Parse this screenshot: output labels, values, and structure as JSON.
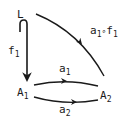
{
  "diagram": {
    "type": "commutative-diagram",
    "nodes": {
      "L": {
        "label": "L"
      },
      "A1": {
        "base": "A",
        "sub": "1"
      },
      "A2": {
        "base": "A",
        "sub": "2"
      }
    },
    "arrows": {
      "f1": {
        "from": "L",
        "to": "A1",
        "style": "hook-inclusion",
        "base": "f",
        "sub": "1"
      },
      "a1": {
        "from": "A1",
        "to": "A2",
        "base": "a",
        "sub": "1"
      },
      "a2": {
        "from": "A1",
        "to": "A2",
        "base": "a",
        "sub": "2"
      },
      "comp": {
        "from": "L",
        "to": "A2",
        "base1": "a",
        "sub1": "1",
        "op": "∘",
        "base2": "f",
        "sub2": "1"
      }
    },
    "colors": {
      "ink": "#1a1a1a",
      "background": "#ffffff"
    }
  }
}
